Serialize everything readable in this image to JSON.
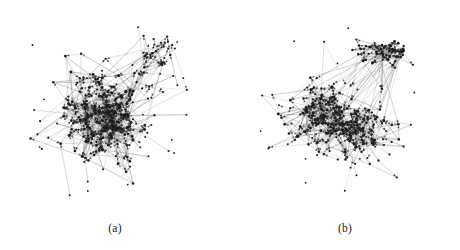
{
  "figure": {
    "background_color": "#ffffff",
    "width": 460,
    "height": 250,
    "kind": "two-panel directed network graph figure"
  },
  "panels": [
    {
      "id": "a",
      "caption": "(a)",
      "graph": {
        "type": "directed-node-link",
        "layout": "force-directed",
        "node_color": "#1c1c1c",
        "edge_color": "#777777",
        "arrow_color": "#2a2a2a",
        "node_count": 310,
        "edge_count": 720,
        "node_radius": 1.15,
        "edge_width": 0.35,
        "seed": 20240117,
        "clusters": [
          {
            "name": "main-core",
            "cx": 105,
            "cy": 118,
            "rx": 46,
            "ry": 44,
            "weight": 0.56,
            "density": 0.96
          },
          {
            "name": "inner-halo",
            "cx": 100,
            "cy": 112,
            "rx": 68,
            "ry": 60,
            "weight": 0.24,
            "density": 0.55
          },
          {
            "name": "upper-right-spur",
            "cx": 160,
            "cy": 52,
            "rx": 28,
            "ry": 22,
            "weight": 0.11,
            "density": 0.4
          },
          {
            "name": "outer-fringe",
            "cx": 104,
            "cy": 116,
            "rx": 92,
            "ry": 82,
            "weight": 0.09,
            "density": 0.16
          }
        ],
        "bounds": {
          "x_min": 12,
          "x_max": 196,
          "y_min": 14,
          "y_max": 212
        }
      }
    },
    {
      "id": "b",
      "caption": "(b)",
      "graph": {
        "type": "directed-node-link",
        "layout": "force-directed",
        "node_color": "#1c1c1c",
        "edge_color": "#777777",
        "arrow_color": "#2a2a2a",
        "node_count": 300,
        "edge_count": 690,
        "node_radius": 1.15,
        "edge_width": 0.35,
        "seed": 77310294,
        "clusters": [
          {
            "name": "main-core",
            "cx": 92,
            "cy": 122,
            "rx": 42,
            "ry": 38,
            "weight": 0.4,
            "density": 0.95
          },
          {
            "name": "right-lobe",
            "cx": 140,
            "cy": 133,
            "rx": 34,
            "ry": 26,
            "weight": 0.18,
            "density": 0.7
          },
          {
            "name": "upper-right-island",
            "cx": 148,
            "cy": 52,
            "rx": 32,
            "ry": 16,
            "weight": 0.17,
            "density": 0.82
          },
          {
            "name": "mid-halo",
            "cx": 110,
            "cy": 118,
            "rx": 66,
            "ry": 56,
            "weight": 0.14,
            "density": 0.45
          },
          {
            "name": "outer-fringe",
            "cx": 112,
            "cy": 114,
            "rx": 96,
            "ry": 84,
            "weight": 0.11,
            "density": 0.15
          }
        ],
        "bounds": {
          "x_min": 15,
          "x_max": 215,
          "y_min": 18,
          "y_max": 212
        }
      }
    }
  ]
}
